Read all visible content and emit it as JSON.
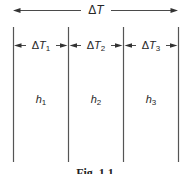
{
  "colors": {
    "line": "#4a4a4a",
    "arrow_fill": "#333333",
    "text": "#262626",
    "background": "#ffffff"
  },
  "title_arrow": {
    "delta": "Δ",
    "symbol": "T"
  },
  "layers": [
    {
      "dt_delta": "Δ",
      "dt_symbol": "T",
      "dt_sub": "1",
      "h_symbol": "h",
      "h_sub": "1"
    },
    {
      "dt_delta": "Δ",
      "dt_symbol": "T",
      "dt_sub": "2",
      "h_symbol": "h",
      "h_sub": "2"
    },
    {
      "dt_delta": "Δ",
      "dt_symbol": "T",
      "dt_sub": "3",
      "h_symbol": "h",
      "h_sub": "3"
    }
  ],
  "caption": "Fig. 1.1"
}
